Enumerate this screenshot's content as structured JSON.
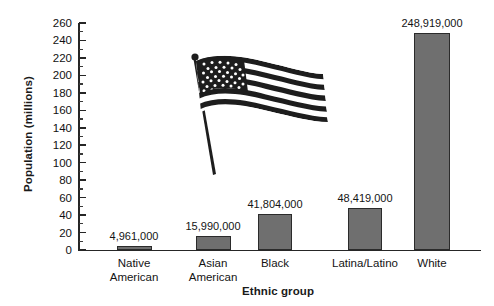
{
  "chart_data": {
    "type": "bar",
    "title": "",
    "xlabel": "Ethnic group",
    "ylabel": "Population (millions)",
    "categories": [
      "Native American",
      "Asian American",
      "Black",
      "Latina/Latino",
      "White"
    ],
    "values": [
      4.961,
      15.99,
      41.804,
      48.419,
      248.919
    ],
    "value_labels": [
      "4,961,000",
      "15,990,000",
      "41,804,000",
      "48,419,000",
      "248,919,000"
    ],
    "category_lines": [
      [
        "Native",
        "American"
      ],
      [
        "Asian",
        "American"
      ],
      [
        "Black"
      ],
      [
        "Latina/Latino"
      ],
      [
        "White"
      ]
    ],
    "ylim": [
      0,
      260
    ],
    "ytick_step": 20,
    "yticks": [
      0,
      20,
      40,
      60,
      80,
      100,
      120,
      140,
      160,
      180,
      200,
      220,
      240,
      260
    ],
    "ytick_labels": [
      "0",
      "20",
      "40",
      "60",
      "80",
      "100",
      "120",
      "140",
      "160",
      "180",
      "200",
      "220",
      "240",
      "260"
    ],
    "minor_ticks": true,
    "grid": false,
    "legend": false,
    "bar_color": "#6f6f6f",
    "bar_edge_color": "#2b2b2b",
    "axis_color": "#262626",
    "background_color": "#ffffff",
    "annotations": [
      {
        "name": "us-flag-illustration",
        "description": "black and white waving United States flag on a pole"
      }
    ]
  }
}
